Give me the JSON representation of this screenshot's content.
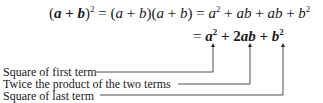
{
  "equation": {
    "line1": {
      "lhs_base": "a + b",
      "lhs_exp": "2",
      "step1": "= (a + b)(a + b)",
      "expansion": "= a² + ab + ab + b²"
    },
    "line2": {
      "result": "= a² + 2ab + b²",
      "terms": [
        "a²",
        "2ab",
        "b²"
      ]
    }
  },
  "annotations": [
    {
      "label": "Square of first term",
      "target": "a²"
    },
    {
      "label": "Twice the product of the two terms",
      "target": "2ab"
    },
    {
      "label": "Square of last term",
      "target": "b²"
    }
  ]
}
